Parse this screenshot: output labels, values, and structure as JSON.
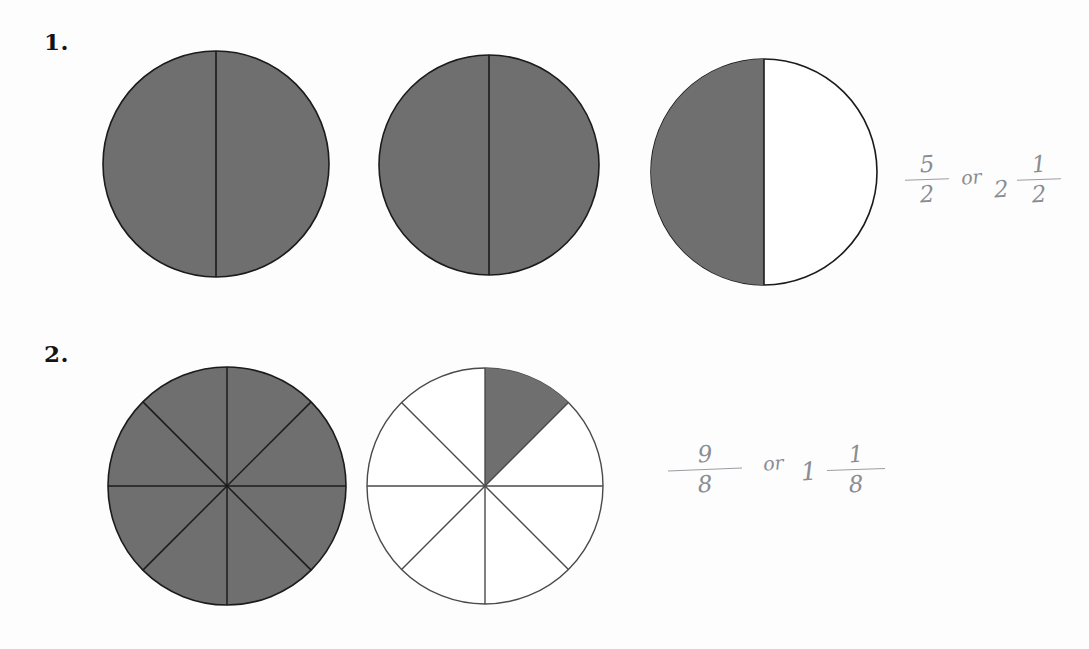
{
  "page": {
    "background_color": "#fdfdfd",
    "ink_color": "#141414",
    "shade_color": "#6f6f6f",
    "pencil_color": "#8a8d92"
  },
  "problems": [
    {
      "number_label": "1.",
      "figures": [
        {
          "name": "circle-halves-full-a",
          "parts": 2,
          "shaded_parts": 2,
          "cx": 215,
          "cy": 163,
          "r": 113,
          "shaded_sectors": [
            0,
            1
          ],
          "divider_angles_deg": [
            90,
            270
          ]
        },
        {
          "name": "circle-halves-full-b",
          "parts": 2,
          "shaded_parts": 2,
          "cx": 487,
          "cy": 163,
          "r": 110,
          "shaded_sectors": [
            0,
            1
          ],
          "divider_angles_deg": [
            90,
            270
          ]
        },
        {
          "name": "circle-halves-one-shaded",
          "parts": 2,
          "shaded_parts": 1,
          "cx": 762,
          "cy": 170,
          "r": 113,
          "shaded_sectors": [
            1
          ],
          "divider_angles_deg": [
            90,
            270
          ]
        }
      ],
      "answer": {
        "improper_numerator": "5",
        "improper_denominator": "2",
        "connector": "or",
        "mixed_whole": "2",
        "mixed_numerator": "1",
        "mixed_denominator": "2",
        "full_text": "5/2 or 2 1/2"
      }
    },
    {
      "number_label": "2.",
      "figures": [
        {
          "name": "circle-eighths-full",
          "parts": 8,
          "shaded_parts": 8,
          "cx": 224,
          "cy": 483,
          "r": 119,
          "shaded_sectors": [
            0,
            1,
            2,
            3,
            4,
            5,
            6,
            7
          ],
          "divider_angles_deg": [
            0,
            45,
            90,
            135,
            180,
            225,
            270,
            315
          ]
        },
        {
          "name": "circle-eighths-one-shaded",
          "parts": 8,
          "shaded_parts": 1,
          "cx": 482,
          "cy": 483,
          "r": 118,
          "shaded_sectors": [
            0
          ],
          "shaded_sector_description": "top-right sector from 12 o'clock to 1:30",
          "divider_angles_deg": [
            0,
            45,
            90,
            135,
            180,
            225,
            270,
            315
          ]
        }
      ],
      "answer": {
        "improper_numerator": "9",
        "improper_denominator": "8",
        "connector": "or",
        "mixed_whole": "1",
        "mixed_numerator": "1",
        "mixed_denominator": "8",
        "full_text": "9/8 or 1 1/8"
      }
    }
  ]
}
